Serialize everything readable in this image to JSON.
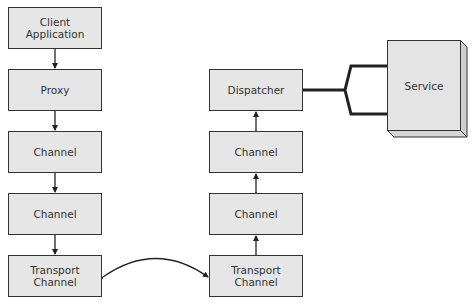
{
  "diagram": {
    "type": "architecture-flow",
    "colors": {
      "box_fill": "#e6e6e6",
      "stroke": "#333333",
      "background": "#ffffff"
    },
    "client_stack": [
      {
        "id": "client-application",
        "label": "Client\nApplication",
        "x": 8,
        "y": 7,
        "w": 94,
        "h": 42
      },
      {
        "id": "proxy",
        "label": "Proxy",
        "x": 8,
        "y": 69,
        "w": 94,
        "h": 42
      },
      {
        "id": "channel-client-1",
        "label": "Channel",
        "x": 8,
        "y": 131,
        "w": 94,
        "h": 42
      },
      {
        "id": "channel-client-2",
        "label": "Channel",
        "x": 8,
        "y": 193,
        "w": 94,
        "h": 42
      },
      {
        "id": "transport-channel-client",
        "label": "Transport\nChannel",
        "x": 8,
        "y": 255,
        "w": 94,
        "h": 42
      }
    ],
    "service_stack": [
      {
        "id": "dispatcher",
        "label": "Dispatcher",
        "x": 209,
        "y": 69,
        "w": 94,
        "h": 42
      },
      {
        "id": "channel-service-1",
        "label": "Channel",
        "x": 209,
        "y": 131,
        "w": 94,
        "h": 42
      },
      {
        "id": "channel-service-2",
        "label": "Channel",
        "x": 209,
        "y": 193,
        "w": 94,
        "h": 42
      },
      {
        "id": "transport-channel-service",
        "label": "Transport\nChannel",
        "x": 209,
        "y": 255,
        "w": 94,
        "h": 42
      }
    ],
    "service": {
      "id": "service",
      "label": "Service",
      "x": 387,
      "y": 40,
      "w": 73,
      "h": 90,
      "depth": 7
    },
    "edges": [
      {
        "from": "client-application",
        "to": "proxy",
        "direction": "down"
      },
      {
        "from": "proxy",
        "to": "channel-client-1",
        "direction": "down"
      },
      {
        "from": "channel-client-1",
        "to": "channel-client-2",
        "direction": "down"
      },
      {
        "from": "channel-client-2",
        "to": "transport-channel-client",
        "direction": "down"
      },
      {
        "from": "transport-channel-client",
        "to": "transport-channel-service",
        "direction": "bidirectional-curve"
      },
      {
        "from": "transport-channel-service",
        "to": "channel-service-2",
        "direction": "up"
      },
      {
        "from": "channel-service-2",
        "to": "channel-service-1",
        "direction": "up"
      },
      {
        "from": "channel-service-1",
        "to": "dispatcher",
        "direction": "up"
      },
      {
        "from": "dispatcher",
        "to": "service",
        "direction": "bracket-connector"
      }
    ]
  }
}
